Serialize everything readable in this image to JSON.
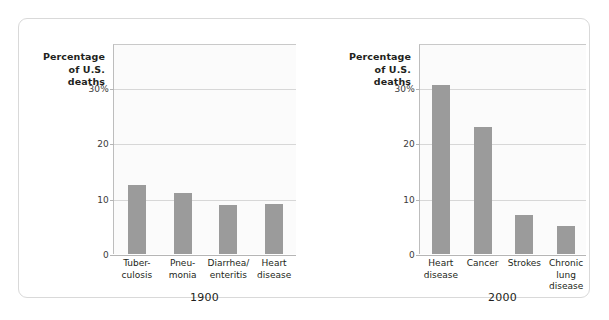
{
  "figure": {
    "axis_title_lines": [
      "Percentage",
      "of U.S.",
      "deaths"
    ],
    "annotation_lines": [
      "Unlike many",
      "leading killers",
      "a century ago,",
      "today's major",
      "killers are more",
      "life-style–related"
    ],
    "colors": {
      "bar": "#9b9b9b",
      "gridline": "#d7d7d7",
      "axis": "#b5b5b5",
      "plot_background": "#fbfbfb",
      "card_border": "#d9d9d9",
      "text": "#231f20"
    }
  },
  "chart_data": [
    {
      "type": "bar",
      "title": "1900",
      "xlabel": "1900",
      "ylabel": "Percentage of U.S. deaths",
      "ylim": [
        0,
        38
      ],
      "yticks": [
        0,
        10,
        20,
        30
      ],
      "ytick_labels": [
        "0",
        "10",
        "20",
        "30%"
      ],
      "grid": true,
      "legend": "none",
      "categories": [
        "Tuber-culosis",
        "Pneu-monia",
        "Diarrhea/enteritis",
        "Heart disease"
      ],
      "category_lines": [
        [
          "Tuber-",
          "culosis"
        ],
        [
          "Pneu-",
          "monia"
        ],
        [
          "Diarrhea/",
          "enteritis"
        ],
        [
          "Heart",
          "disease"
        ]
      ],
      "values": [
        12.5,
        11,
        8.8,
        9
      ]
    },
    {
      "type": "bar",
      "title": "2000",
      "xlabel": "2000",
      "ylabel": "Percentage of U.S. deaths",
      "ylim": [
        0,
        38
      ],
      "yticks": [
        0,
        10,
        20,
        30
      ],
      "ytick_labels": [
        "0",
        "10",
        "20",
        "30%"
      ],
      "grid": true,
      "legend": "none",
      "annotation": "Unlike many leading killers a century ago, today's major killers are more life-style–related",
      "categories": [
        "Heart disease",
        "Cancer",
        "Strokes",
        "Chronic lung disease"
      ],
      "category_lines": [
        [
          "Heart",
          "disease"
        ],
        [
          "Cancer",
          ""
        ],
        [
          "Strokes",
          ""
        ],
        [
          "Chronic",
          "lung disease"
        ]
      ],
      "values": [
        30.5,
        23,
        7,
        5
      ]
    }
  ]
}
